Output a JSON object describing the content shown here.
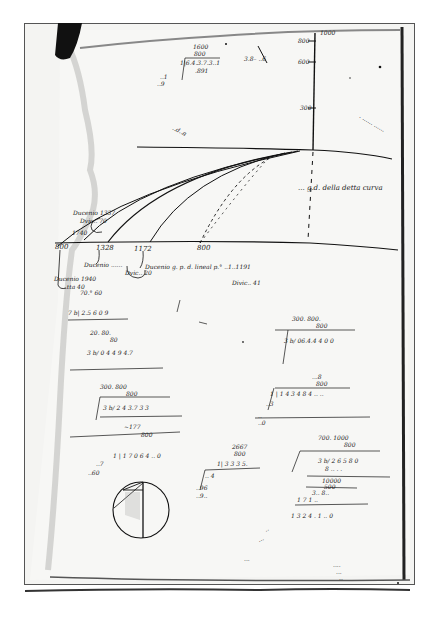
{
  "document": {
    "type": "manuscript folio",
    "description": "Handwritten page with vertical scale, horizontal baseline and family of parabolic trajectory curves with numeric calculations"
  },
  "vertical_scale": {
    "top_label": "1000",
    "ticks": [
      "800",
      "600",
      "300"
    ]
  },
  "top_calc": {
    "lines": [
      "1600",
      "800",
      "1|6.4.3.7.3..1",
      ".891",
      "..1",
      "..9"
    ]
  },
  "top_note": "3.8– ..6",
  "upper_left_label": "..d..a",
  "right_column_note": ". ...... ......",
  "curve_label": "...  g.d. della detta curva",
  "baseline": {
    "ticks": [
      "800",
      "1328",
      "1172",
      "800"
    ]
  },
  "left_annotations": {
    "upper": [
      "Ducenio 1337",
      "Dvic..  70"
    ],
    "lower_tick": "1740"
  },
  "under_baseline": {
    "note_1": "Ducenio ......",
    "note_1b": "Dvic.. 20",
    "note_2": "Ducenio g. p. d. lineal p.° ..1..1191",
    "note_2b": "Divic.. 41",
    "note_3": "Ducenio 1940",
    "note_3b": "..tta 40",
    "note_4": "70.° 60"
  },
  "calc_blocks": {
    "left_1": [
      "7 b| 2.5 6 0 9",
      "20. 80.",
      "80",
      "3 b/ 0 4 4 9 4.7"
    ],
    "left_2": [
      "300. 800",
      "800",
      "3 b/ 2 4 3.7 3 3",
      "~177",
      "800"
    ],
    "left_3": [
      "1 | 1 7 0 6 4 .. 0",
      "..7",
      "..60"
    ],
    "middle": [
      "2667",
      "800",
      "1| 3 3 3 5.",
      ".. 4",
      "..96",
      "..9.."
    ],
    "right_1": [
      "300. 800.",
      "800",
      "3 b/ 06.4.4 4 0 0"
    ],
    "right_2": [
      "...8",
      "800",
      "1 | 1 4 3 4 8 4 .. ..",
      "..3",
      "..",
      "..0"
    ],
    "right_3": [
      "700. 1000",
      "800",
      "3 b/ 2 6 5 8 0",
      "8 .. . .",
      "10000",
      "500",
      "3.. 8..",
      "1 7 1 ..",
      "1 3 2 4 . 1 .. 0"
    ],
    "bottom_scattered": [
      "..",
      "...",
      "..."
    ],
    "bottom_right": [
      "....",
      "...",
      ".."
    ]
  },
  "diagram": {
    "circle": "circle with vertical diameter and inscribed chords"
  }
}
